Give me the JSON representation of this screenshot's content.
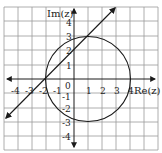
{
  "figure": {
    "type": "complex-plane-diagram",
    "x_axis_label": "Re(z)",
    "y_axis_label": "Im(z)",
    "origin_label": "0",
    "x_ticks": [
      "-4",
      "-3",
      "-2",
      "-1",
      "1",
      "2",
      "3",
      "4"
    ],
    "y_ticks": [
      "4",
      "3",
      "2",
      "1",
      "-1",
      "-2",
      "-3",
      "-4"
    ],
    "grid_range": {
      "x": [
        -5,
        5
      ],
      "y": [
        -5,
        5
      ]
    },
    "circle": {
      "center": [
        1,
        0
      ],
      "radius": 3
    },
    "line": {
      "equation": "y = x + 2",
      "through": [
        [
          -2,
          0
        ],
        [
          1,
          3
        ]
      ]
    },
    "colors": {
      "grid": "#9a9a9a",
      "curves": "#1a1a1a",
      "axes": "#1a1a1a",
      "background": "#ffffff"
    }
  }
}
